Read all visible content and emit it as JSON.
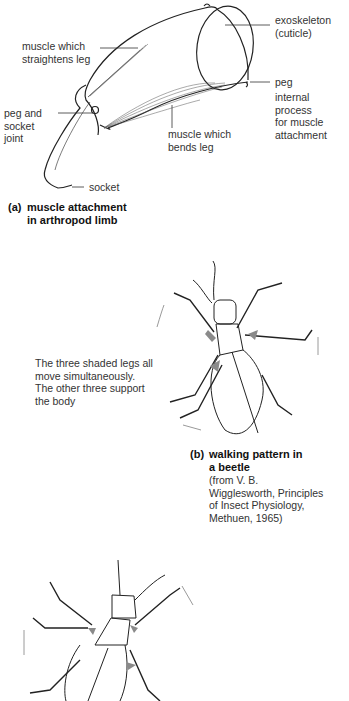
{
  "figure_a": {
    "labels": {
      "exoskeleton": "exoskeleton\n(cuticle)",
      "muscle_straightens": "muscle which\nstraightens leg",
      "peg": "peg",
      "internal_process": "internal process\nfor muscle\nattachment",
      "peg_socket_joint": "peg and\nsocket\njoint",
      "muscle_bends": "muscle which\nbends leg",
      "socket": "socket"
    },
    "caption": {
      "letter": "(a)",
      "text": "muscle attachment\nin arthropod limb"
    }
  },
  "figure_b": {
    "note": "The three shaded legs all\nmove simultaneously.\nThe other three support\nthe body",
    "caption": {
      "letter": "(b)",
      "text": "walking pattern in\na beetle",
      "source": "(from V. B.\nWigglesworth, Principles\nof Insect Physiology,\nMethuen, 1965)"
    }
  },
  "colors": {
    "line": "#222222",
    "shade": "#8a8a8a",
    "arrow": "#9a9a9a"
  }
}
